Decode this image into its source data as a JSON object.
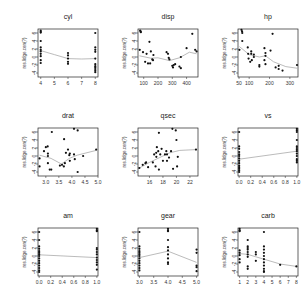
{
  "chart_data": {
    "type": "scatter",
    "layout": {
      "rows": 3,
      "cols": 3
    },
    "ylabel": "res.lidge.cen(?)",
    "yticks": [
      -4,
      -2,
      0,
      2,
      4,
      6
    ],
    "ylim": [
      -5,
      7
    ],
    "panels": [
      {
        "title": "cyl",
        "xlim": [
          3.8,
          8.2
        ],
        "xticks": [
          4,
          5,
          6,
          7,
          8
        ],
        "points": [
          [
            4,
            6.6
          ],
          [
            4,
            6.3
          ],
          [
            4,
            6.1
          ],
          [
            4,
            4
          ],
          [
            4,
            2.4
          ],
          [
            4,
            1.8
          ],
          [
            4,
            1.4
          ],
          [
            4,
            0.8
          ],
          [
            4,
            0.2
          ],
          [
            4,
            -0.8
          ],
          [
            4,
            -1.5
          ],
          [
            6,
            1
          ],
          [
            6,
            0.4
          ],
          [
            6,
            -0.4
          ],
          [
            6,
            -1.2
          ],
          [
            6,
            -1.7
          ],
          [
            8,
            6
          ],
          [
            8,
            2.4
          ],
          [
            8,
            1.8
          ],
          [
            8,
            1.3
          ],
          [
            8,
            -0.4
          ],
          [
            8,
            -1.8
          ],
          [
            8,
            -2.3
          ],
          [
            8,
            -2.6
          ],
          [
            8,
            -3
          ],
          [
            8,
            -3.4
          ],
          [
            8,
            -3.8
          ]
        ],
        "smooth": [
          [
            4,
            1.6
          ],
          [
            5,
            0.6
          ],
          [
            6,
            -0.4
          ],
          [
            7,
            -0.5
          ],
          [
            8,
            -0.4
          ]
        ]
      },
      {
        "title": "disp",
        "xlim": [
          60,
          480
        ],
        "xticks": [
          100,
          200,
          300,
          400
        ],
        "points": [
          [
            75,
            6.6
          ],
          [
            78,
            6.4
          ],
          [
            80,
            6.2
          ],
          [
            72,
            1.8
          ],
          [
            95,
            1.2
          ],
          [
            110,
            -1.2
          ],
          [
            120,
            0.8
          ],
          [
            130,
            -1.6
          ],
          [
            140,
            3.8
          ],
          [
            145,
            -1.6
          ],
          [
            150,
            1.4
          ],
          [
            160,
            -0.6
          ],
          [
            165,
            -0.8
          ],
          [
            168,
            0.5
          ],
          [
            260,
            1.2
          ],
          [
            270,
            0.8
          ],
          [
            275,
            -0.2
          ],
          [
            280,
            -0.6
          ],
          [
            300,
            -2.2
          ],
          [
            305,
            -2.6
          ],
          [
            310,
            -2
          ],
          [
            320,
            -1.8
          ],
          [
            350,
            -2.4
          ],
          [
            360,
            -2.8
          ],
          [
            360,
            0
          ],
          [
            400,
            2.2
          ],
          [
            440,
            5.8
          ],
          [
            460,
            1.8
          ],
          [
            470,
            1.4
          ]
        ],
        "smooth": [
          [
            70,
            0.3
          ],
          [
            150,
            -0.3
          ],
          [
            200,
            -0.2
          ],
          [
            280,
            -0.9
          ],
          [
            350,
            -0.2
          ],
          [
            420,
            1.2
          ],
          [
            470,
            0.8
          ]
        ]
      },
      {
        "title": "hp",
        "xlim": [
          45,
          340
        ],
        "xticks": [
          50,
          100,
          200,
          300
        ],
        "points": [
          [
            52,
            1.8
          ],
          [
            62,
            6.8
          ],
          [
            65,
            6.4
          ],
          [
            66,
            6
          ],
          [
            66,
            4
          ],
          [
            93,
            2.4
          ],
          [
            95,
            0.8
          ],
          [
            97,
            -0.4
          ],
          [
            105,
            -1.2
          ],
          [
            110,
            1.4
          ],
          [
            110,
            0.8
          ],
          [
            113,
            -0.8
          ],
          [
            123,
            0.6
          ],
          [
            123,
            0
          ],
          [
            150,
            -2
          ],
          [
            150,
            -2.4
          ],
          [
            175,
            2.2
          ],
          [
            175,
            -0.8
          ],
          [
            180,
            0.3
          ],
          [
            180,
            -1.8
          ],
          [
            180,
            1
          ],
          [
            205,
            1.6
          ],
          [
            215,
            5.8
          ],
          [
            230,
            -2.6
          ],
          [
            245,
            -3
          ],
          [
            245,
            -2.2
          ],
          [
            264,
            -3.4
          ],
          [
            335,
            -2
          ]
        ],
        "smooth": [
          [
            52,
            2.6
          ],
          [
            100,
            0.6
          ],
          [
            150,
            0
          ],
          [
            180,
            0.3
          ],
          [
            220,
            -1.2
          ],
          [
            280,
            -2.4
          ],
          [
            335,
            -2.8
          ]
        ]
      },
      {
        "title": "drat",
        "xlim": [
          2.7,
          5.0
        ],
        "xticks": [
          3.0,
          3.5,
          4.0,
          4.5,
          5.0
        ],
        "points": [
          [
            2.76,
            -0.6
          ],
          [
            2.76,
            -2.6
          ],
          [
            2.93,
            1.2
          ],
          [
            3.0,
            2.2
          ],
          [
            3.07,
            2.4
          ],
          [
            3.08,
            0.6
          ],
          [
            3.08,
            0
          ],
          [
            3.15,
            -3.4
          ],
          [
            3.08,
            -1.8
          ],
          [
            3.21,
            -3.4
          ],
          [
            3.23,
            6
          ],
          [
            3.54,
            -2.4
          ],
          [
            3.62,
            -2.2
          ],
          [
            3.69,
            -2.6
          ],
          [
            3.7,
            4.2
          ],
          [
            3.73,
            -1.8
          ],
          [
            3.77,
            0.8
          ],
          [
            3.85,
            1.6
          ],
          [
            3.9,
            0.2
          ],
          [
            3.92,
            -1.2
          ],
          [
            3.92,
            0.6
          ],
          [
            4.08,
            6.8
          ],
          [
            4.08,
            0.4
          ],
          [
            4.11,
            -0.8
          ],
          [
            4.22,
            6.4
          ],
          [
            4.22,
            -4
          ],
          [
            4.43,
            0
          ],
          [
            4.93,
            1.6
          ]
        ],
        "smooth": [
          [
            2.76,
            0.2
          ],
          [
            3.2,
            -0.6
          ],
          [
            3.6,
            -2
          ],
          [
            3.9,
            -0.6
          ],
          [
            4.2,
            0.2
          ],
          [
            4.93,
            1.4
          ]
        ]
      },
      {
        "title": "qsec",
        "xlim": [
          14.3,
          23.2
        ],
        "xticks": [
          16,
          18,
          20,
          22
        ],
        "points": [
          [
            14.5,
            -3
          ],
          [
            15,
            -2.2
          ],
          [
            15.4,
            -1.8
          ],
          [
            15.5,
            -1.6
          ],
          [
            15.8,
            -2.8
          ],
          [
            16.5,
            -1.6
          ],
          [
            16.7,
            0.4
          ],
          [
            16.9,
            -2.6
          ],
          [
            17,
            0.8
          ],
          [
            17.02,
            -0.2
          ],
          [
            17.1,
            2.2
          ],
          [
            17.3,
            1.2
          ],
          [
            17.4,
            -3.4
          ],
          [
            17.4,
            5.8
          ],
          [
            17.6,
            0.4
          ],
          [
            17.8,
            1.8
          ],
          [
            18,
            -1.2
          ],
          [
            18.3,
            0.4
          ],
          [
            18.5,
            1.2
          ],
          [
            18.6,
            -1.2
          ],
          [
            18.6,
            0.4
          ],
          [
            18.9,
            -0.4
          ],
          [
            19.2,
            1.2
          ],
          [
            19.4,
            6.8
          ],
          [
            19.5,
            -3.2
          ],
          [
            19.9,
            6.4
          ],
          [
            20,
            4
          ],
          [
            20.1,
            -2.6
          ],
          [
            20.2,
            -0.2
          ],
          [
            22.9,
            1.6
          ]
        ],
        "smooth": [
          [
            14.5,
            -3
          ],
          [
            16,
            -1.6
          ],
          [
            17.5,
            -0.4
          ],
          [
            19,
            0.8
          ],
          [
            20.5,
            1.4
          ],
          [
            22.9,
            1.6
          ]
        ]
      },
      {
        "title": "vs",
        "xlim": [
          -0.02,
          1.02
        ],
        "xticks": [
          0.0,
          0.2,
          0.4,
          0.6,
          0.8,
          1.0
        ],
        "points": [
          [
            0,
            6
          ],
          [
            0,
            2.4
          ],
          [
            0,
            1.8
          ],
          [
            0,
            1
          ],
          [
            0,
            0.4
          ],
          [
            0,
            0
          ],
          [
            0,
            -0.6
          ],
          [
            0,
            -1.2
          ],
          [
            0,
            -1.8
          ],
          [
            0,
            -2.4
          ],
          [
            0,
            -2.8
          ],
          [
            0,
            -3.2
          ],
          [
            0,
            -3.6
          ],
          [
            0,
            -4
          ],
          [
            1,
            6.8
          ],
          [
            1,
            6.4
          ],
          [
            1,
            6
          ],
          [
            1,
            4
          ],
          [
            1,
            2.4
          ],
          [
            1,
            2
          ],
          [
            1,
            1.6
          ],
          [
            1,
            1.2
          ],
          [
            1,
            0.6
          ],
          [
            1,
            0
          ],
          [
            1,
            -0.8
          ],
          [
            1,
            -1.2
          ],
          [
            1,
            -1.6
          ]
        ],
        "smooth": [
          [
            0,
            -0.8
          ],
          [
            1,
            1.2
          ]
        ]
      },
      {
        "title": "am",
        "xlim": [
          -0.02,
          1.02
        ],
        "xticks": [
          0.0,
          0.2,
          0.4,
          0.6,
          0.8,
          1.0
        ],
        "points": [
          [
            0,
            6
          ],
          [
            0,
            4
          ],
          [
            0,
            2.4
          ],
          [
            0,
            1.8
          ],
          [
            0,
            1.2
          ],
          [
            0,
            0.8
          ],
          [
            0,
            0.4
          ],
          [
            0,
            0
          ],
          [
            0,
            -0.6
          ],
          [
            0,
            -1.2
          ],
          [
            0,
            -1.8
          ],
          [
            0,
            -2.4
          ],
          [
            0,
            -3
          ],
          [
            0,
            -3.6
          ],
          [
            0,
            -4
          ],
          [
            1,
            6.8
          ],
          [
            1,
            6.4
          ],
          [
            1,
            6.2
          ],
          [
            1,
            2
          ],
          [
            1,
            1.6
          ],
          [
            1,
            1
          ],
          [
            1,
            0.4
          ],
          [
            1,
            -0.4
          ],
          [
            1,
            -1
          ],
          [
            1,
            -1.6
          ],
          [
            1,
            -2.2
          ],
          [
            1,
            -3.4
          ]
        ],
        "smooth": [
          [
            0,
            0.3
          ],
          [
            1,
            -0.4
          ]
        ]
      },
      {
        "title": "gear",
        "xlim": [
          2.95,
          5.05
        ],
        "xticks": [
          3.0,
          3.5,
          4.0,
          4.5,
          5.0
        ],
        "points": [
          [
            3,
            6
          ],
          [
            3,
            2.4
          ],
          [
            3,
            1.8
          ],
          [
            3,
            1.2
          ],
          [
            3,
            0.8
          ],
          [
            3,
            0.4
          ],
          [
            3,
            0
          ],
          [
            3,
            -0.6
          ],
          [
            3,
            -1.2
          ],
          [
            3,
            -1.8
          ],
          [
            3,
            -2.4
          ],
          [
            3,
            -3
          ],
          [
            3,
            -3.6
          ],
          [
            4,
            6.8
          ],
          [
            4,
            6.4
          ],
          [
            4,
            6.2
          ],
          [
            4,
            4
          ],
          [
            4,
            2.2
          ],
          [
            4,
            1.4
          ],
          [
            4,
            0.4
          ],
          [
            4,
            -0.6
          ],
          [
            4,
            -1.6
          ],
          [
            4,
            -2
          ],
          [
            5,
            1.6
          ],
          [
            5,
            0.8
          ],
          [
            5,
            -2.4
          ],
          [
            5,
            -2.8
          ],
          [
            5,
            -3.8
          ]
        ],
        "smooth": [
          [
            3,
            -0.4
          ],
          [
            4,
            1.2
          ],
          [
            5,
            -1.6
          ]
        ]
      },
      {
        "title": "carb",
        "xlim": [
          0.8,
          8.2
        ],
        "xticks": [
          1,
          2,
          3,
          4,
          5,
          6,
          7,
          8
        ],
        "points": [
          [
            1,
            6.8
          ],
          [
            1,
            6.4
          ],
          [
            1,
            6.2
          ],
          [
            1,
            1.4
          ],
          [
            1,
            0.8
          ],
          [
            1,
            0.2
          ],
          [
            1,
            -0.8
          ],
          [
            1,
            -1.6
          ],
          [
            2,
            4
          ],
          [
            2,
            2.4
          ],
          [
            2,
            2
          ],
          [
            2,
            1.6
          ],
          [
            2,
            1
          ],
          [
            2,
            0.4
          ],
          [
            2,
            -0.2
          ],
          [
            2,
            -2.6
          ],
          [
            2,
            -3.2
          ],
          [
            3,
            1
          ],
          [
            3,
            0.4
          ],
          [
            3,
            -1.2
          ],
          [
            4,
            6
          ],
          [
            4,
            2.4
          ],
          [
            4,
            1.6
          ],
          [
            4,
            0.8
          ],
          [
            4,
            0
          ],
          [
            4,
            -0.8
          ],
          [
            4,
            -1.6
          ],
          [
            4,
            -2.4
          ],
          [
            4,
            -3.2
          ],
          [
            4,
            -3.8
          ],
          [
            4,
            -4
          ],
          [
            6,
            -2.2
          ],
          [
            8,
            -2.6
          ]
        ],
        "smooth": [
          [
            1,
            0.6
          ],
          [
            2,
            0.4
          ],
          [
            3,
            -0.2
          ],
          [
            4,
            -0.8
          ],
          [
            6,
            -2
          ],
          [
            8,
            -2.6
          ]
        ]
      }
    ]
  },
  "colors": {
    "points": "#111111",
    "smooth": "#aaaaaa",
    "axis": "#222222"
  }
}
